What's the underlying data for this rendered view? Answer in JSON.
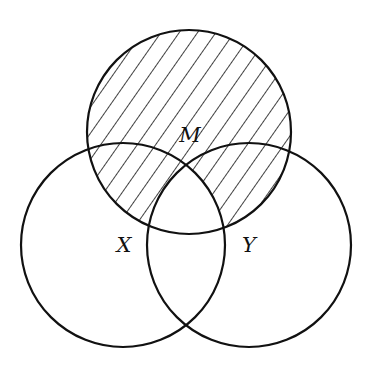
{
  "diagram": {
    "type": "venn",
    "stroke_color": "#111111",
    "background": "#ffffff",
    "hatch": {
      "description": "diagonal hatching covering circle M except region common to M, X and Y",
      "angle_deg": 55,
      "spacing_px": 15
    },
    "sets": [
      {
        "id": "M",
        "label": "M",
        "cx": 189,
        "cy": 132,
        "r": 102,
        "label_x": 190,
        "label_y": 135
      },
      {
        "id": "X",
        "label": "X",
        "cx": 123,
        "cy": 245,
        "r": 102,
        "label_x": 124,
        "label_y": 245
      },
      {
        "id": "Y",
        "label": "Y",
        "cx": 249,
        "cy": 245,
        "r": 102,
        "label_x": 249,
        "label_y": 245
      }
    ],
    "shaded_regions": [
      "M only",
      "M∩X only",
      "M∩Y only"
    ],
    "unshaded_regions": [
      "M∩X∩Y",
      "X only",
      "Y only",
      "X∩Y only"
    ]
  }
}
